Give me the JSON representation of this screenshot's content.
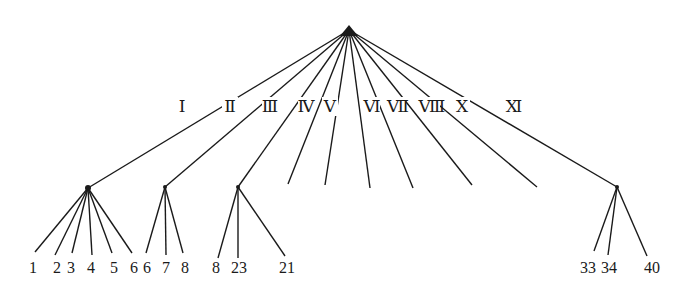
{
  "diagram": {
    "type": "dendrogram",
    "root": {
      "x": 349,
      "y": 30
    },
    "colors": {
      "line": "#1a1a1a",
      "background": "#ffffff"
    },
    "branches": [
      {
        "label": "Ⅰ",
        "label_pos": [
          182,
          112
        ],
        "node": [
          88,
          188
        ],
        "leaves": [
          {
            "label": "1",
            "end": [
              35,
              252
            ],
            "text": [
              33,
              273
            ]
          },
          {
            "label": "2",
            "end": [
              55,
              255
            ],
            "text": [
              57,
              273
            ]
          },
          {
            "label": "3",
            "end": [
              72,
              253
            ],
            "text": [
              71,
              273
            ]
          },
          {
            "label": "4",
            "end": [
              92,
              255
            ],
            "text": [
              91,
              273
            ]
          },
          {
            "label": "5",
            "end": [
              112,
              253
            ],
            "text": [
              114,
              273
            ]
          },
          {
            "label": "6",
            "end": [
              132,
              253
            ],
            "text": [
              134,
              273
            ]
          }
        ]
      },
      {
        "label": "Ⅱ",
        "label_pos": [
          230,
          112
        ],
        "node": [
          165,
          187
        ],
        "leaves": [
          {
            "label": "6",
            "end": [
              146,
              253
            ],
            "text": [
              147,
              273
            ]
          },
          {
            "label": "7",
            "end": [
              166,
              255
            ],
            "text": [
              166,
              273
            ]
          },
          {
            "label": "8",
            "end": [
              183,
              253
            ],
            "text": [
              185,
              273
            ]
          }
        ]
      },
      {
        "label": "Ⅲ",
        "label_pos": [
          270,
          112
        ],
        "node": [
          238,
          187
        ],
        "leaves": [
          {
            "label": "8",
            "end": [
              218,
              258
            ],
            "text": [
              216,
              273
            ]
          },
          {
            "label": "23",
            "end": [
              238,
              258
            ],
            "text": [
              239,
              273
            ]
          },
          {
            "label": "21",
            "end": [
              285,
              256
            ],
            "text": [
              287,
              273
            ]
          }
        ]
      },
      {
        "label": "Ⅳ",
        "label_pos": [
          306,
          112
        ],
        "end": [
          288,
          184
        ]
      },
      {
        "label": "Ⅴ",
        "label_pos": [
          330,
          112
        ],
        "end": [
          325,
          185
        ]
      },
      {
        "label": "Ⅵ",
        "label_pos": [
          372,
          112
        ],
        "end": [
          370,
          188
        ]
      },
      {
        "label": "Ⅶ",
        "label_pos": [
          398,
          112
        ],
        "end": [
          413,
          188
        ]
      },
      {
        "label": "Ⅷ",
        "label_pos": [
          432,
          112
        ],
        "end": [
          472,
          185
        ]
      },
      {
        "label": "Ⅹ",
        "label_pos": [
          462,
          112
        ],
        "end": [
          537,
          187
        ]
      },
      {
        "label": "Ⅺ",
        "label_pos": [
          514,
          112
        ],
        "node": [
          617,
          187
        ],
        "leaves": [
          {
            "label": "33",
            "end": [
              594,
              251
            ],
            "text": [
              588,
              273
            ]
          },
          {
            "label": "34",
            "end": [
              608,
              255
            ],
            "text": [
              609,
              273
            ]
          },
          {
            "label": "40",
            "end": [
              647,
              256
            ],
            "text": [
              652,
              273
            ]
          }
        ]
      }
    ]
  }
}
